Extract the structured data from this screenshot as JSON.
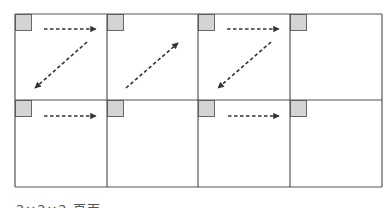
{
  "diagram": {
    "type": "grid-with-arrows",
    "grid": {
      "rows": 2,
      "cols": 4,
      "x_lines": [
        15,
        107,
        198,
        290,
        382
      ],
      "y_lines": [
        14,
        100,
        187
      ],
      "line_color": "#555555",
      "corner_square_size": 16,
      "corner_square_fill": "#d4d4d4",
      "corner_square_stroke": "#666666"
    },
    "arrows": [
      {
        "cell": "r1c1",
        "direction": "right",
        "x1": 44,
        "y1": 29,
        "x2": 96,
        "y2": 29
      },
      {
        "cell": "r1c1",
        "direction": "down-left",
        "x1": 87,
        "y1": 42,
        "x2": 35,
        "y2": 88
      },
      {
        "cell": "r1c2",
        "direction": "up-right",
        "x1": 126,
        "y1": 88,
        "x2": 178,
        "y2": 43
      },
      {
        "cell": "r1c3",
        "direction": "right",
        "x1": 227,
        "y1": 29,
        "x2": 279,
        "y2": 29
      },
      {
        "cell": "r1c3",
        "direction": "down-left",
        "x1": 271,
        "y1": 42,
        "x2": 218,
        "y2": 88
      },
      {
        "cell": "r2c1",
        "direction": "right",
        "x1": 44,
        "y1": 116,
        "x2": 96,
        "y2": 116
      },
      {
        "cell": "r2c3",
        "direction": "right",
        "x1": 228,
        "y1": 116,
        "x2": 279,
        "y2": 116
      }
    ],
    "arrow_color": "#333333"
  },
  "caption": {
    "text": "2×2×2 页面"
  }
}
